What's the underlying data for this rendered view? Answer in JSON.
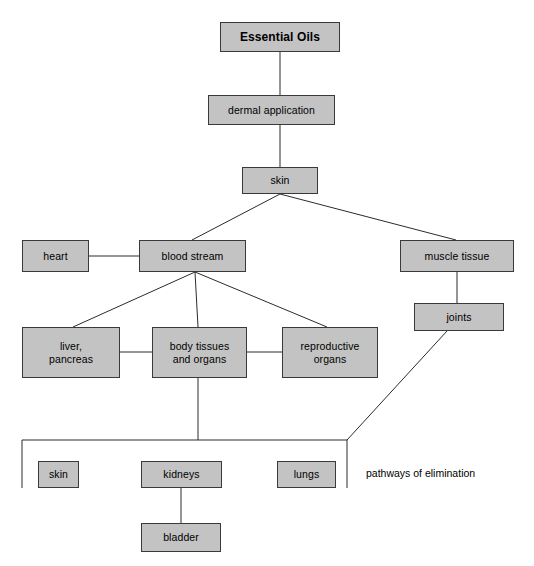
{
  "diagram": {
    "title_node": "Essential Oils",
    "annotation": "pathways of elimination",
    "colors": {
      "node_fill": "#c3c3c3",
      "node_border": "#3a3a3a",
      "line": "#2b2b2b",
      "background": "#ffffff",
      "text": "#000000"
    },
    "nodes": [
      {
        "id": "essential-oils",
        "label": "Essential Oils"
      },
      {
        "id": "dermal-application",
        "label": "dermal application"
      },
      {
        "id": "skin",
        "label": "skin"
      },
      {
        "id": "heart",
        "label": "heart"
      },
      {
        "id": "blood-stream",
        "label": "blood stream"
      },
      {
        "id": "muscle-tissue",
        "label": "muscle tissue"
      },
      {
        "id": "joints",
        "label": "joints"
      },
      {
        "id": "liver-pancreas",
        "label": "liver,\npancreas"
      },
      {
        "id": "body-tissues",
        "label": "body tissues\nand organs"
      },
      {
        "id": "reproductive-organs",
        "label": "reproductive\norgans"
      },
      {
        "id": "skin-elimination",
        "label": "skin"
      },
      {
        "id": "kidneys",
        "label": "kidneys"
      },
      {
        "id": "lungs",
        "label": "lungs"
      },
      {
        "id": "bladder",
        "label": "bladder"
      }
    ],
    "edges": [
      {
        "from": "essential-oils",
        "to": "dermal-application"
      },
      {
        "from": "dermal-application",
        "to": "skin"
      },
      {
        "from": "skin",
        "to": "blood-stream"
      },
      {
        "from": "skin",
        "to": "muscle-tissue"
      },
      {
        "from": "heart",
        "to": "blood-stream"
      },
      {
        "from": "blood-stream",
        "to": "liver-pancreas"
      },
      {
        "from": "blood-stream",
        "to": "body-tissues"
      },
      {
        "from": "blood-stream",
        "to": "reproductive-organs"
      },
      {
        "from": "liver-pancreas",
        "to": "body-tissues"
      },
      {
        "from": "body-tissues",
        "to": "reproductive-organs"
      },
      {
        "from": "muscle-tissue",
        "to": "joints"
      },
      {
        "from": "body-tissues",
        "to": "elimination-bracket"
      },
      {
        "from": "joints",
        "to": "elimination-bracket"
      },
      {
        "from": "kidneys",
        "to": "bladder"
      }
    ]
  }
}
